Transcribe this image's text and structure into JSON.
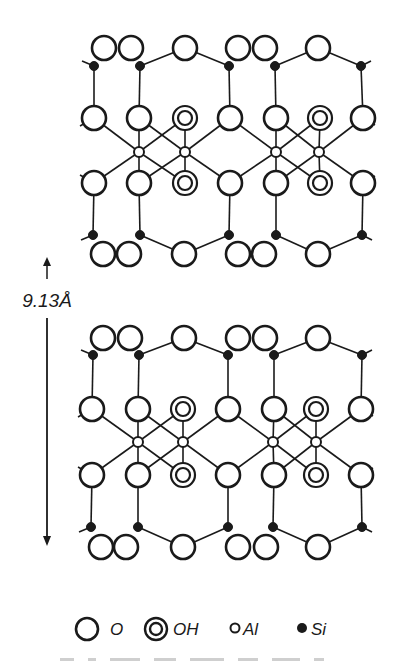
{
  "figure": {
    "dimension": {
      "label": "9.13Å",
      "x": 47,
      "arrow_top": 257,
      "label_y": 307,
      "shaft_start": 318,
      "arrow_bottom": 546
    },
    "style": {
      "stroke": "#1a1a1a",
      "atom_fill": "#ffffff",
      "si_fill": "#1a1a1a",
      "background": "#ffffff"
    },
    "radii": {
      "O": 12,
      "OH_outer": 12,
      "OH_inner": 7,
      "Al": 5,
      "Si": 4.5
    },
    "layers": [
      {
        "name": "upper-layer",
        "rows": {
          "top_O": {
            "y": 48,
            "x": [
              104,
              131,
              185,
              238,
              265,
              318
            ]
          },
          "top_Si": {
            "y": 66,
            "x": [
              94,
              140,
              229,
              275,
              361
            ]
          },
          "mid_upper": {
            "y": 118,
            "atoms": [
              {
                "t": "O",
                "x": 94
              },
              {
                "t": "O",
                "x": 139
              },
              {
                "t": "OH",
                "x": 185
              },
              {
                "t": "O",
                "x": 230
              },
              {
                "t": "O",
                "x": 276
              },
              {
                "t": "OH",
                "x": 320
              },
              {
                "t": "O",
                "x": 363
              }
            ]
          },
          "Al": {
            "y": 152,
            "x": [
              139,
              185,
              276,
              319
            ]
          },
          "mid_lower": {
            "y": 183,
            "atoms": [
              {
                "t": "O",
                "x": 94
              },
              {
                "t": "O",
                "x": 139
              },
              {
                "t": "OH",
                "x": 185
              },
              {
                "t": "O",
                "x": 230
              },
              {
                "t": "O",
                "x": 276
              },
              {
                "t": "OH",
                "x": 320
              },
              {
                "t": "O",
                "x": 363
              }
            ]
          },
          "bot_Si": {
            "y": 235,
            "x": [
              93,
              140,
              229,
              276,
              362
            ]
          },
          "bot_O": {
            "y": 254,
            "x": [
              103,
              129,
              184,
              238,
              264,
              318
            ]
          }
        }
      },
      {
        "name": "lower-layer",
        "rows": {
          "top_O": {
            "y": 338,
            "x": [
              103,
              130,
              184,
              238,
              265,
              318
            ]
          },
          "top_Si": {
            "y": 355,
            "x": [
              93,
              139,
              228,
              274,
              362
            ]
          },
          "mid_upper": {
            "y": 409,
            "atoms": [
              {
                "t": "O",
                "x": 92
              },
              {
                "t": "O",
                "x": 138
              },
              {
                "t": "OH",
                "x": 183
              },
              {
                "t": "O",
                "x": 228
              },
              {
                "t": "O",
                "x": 274
              },
              {
                "t": "OH",
                "x": 316
              },
              {
                "t": "O",
                "x": 361
              }
            ]
          },
          "Al": {
            "y": 442,
            "x": [
              138,
              183,
              273,
              316
            ]
          },
          "mid_lower": {
            "y": 475,
            "atoms": [
              {
                "t": "O",
                "x": 92
              },
              {
                "t": "O",
                "x": 138
              },
              {
                "t": "OH",
                "x": 183
              },
              {
                "t": "O",
                "x": 228
              },
              {
                "t": "O",
                "x": 274
              },
              {
                "t": "OH",
                "x": 316
              },
              {
                "t": "O",
                "x": 361
              }
            ]
          },
          "bot_Si": {
            "y": 527,
            "x": [
              91,
              138,
              228,
              273,
              362
            ]
          },
          "bot_O": {
            "y": 547,
            "x": [
              101,
              126,
              183,
              238,
              266,
              318
            ]
          }
        }
      }
    ],
    "legend": {
      "y": 629,
      "items": [
        {
          "symbol": "O",
          "label": "O",
          "x": 87,
          "label_x": 110
        },
        {
          "symbol": "OH",
          "label": "OH",
          "x": 156,
          "label_x": 173
        },
        {
          "symbol": "Al",
          "label": "Al",
          "x": 235,
          "label_x": 243
        },
        {
          "symbol": "Si",
          "label": "Si",
          "x": 302,
          "label_x": 311
        }
      ]
    },
    "caption": {
      "text": "",
      "note": "caption line clipped at image bottom edge"
    }
  }
}
